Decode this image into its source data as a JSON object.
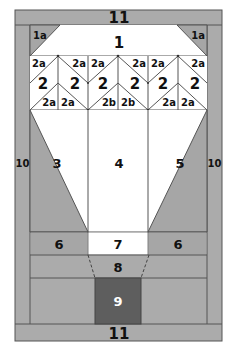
{
  "diagram": {
    "type": "quilt-block-piecing-diagram",
    "colors": {
      "background": "#ffffff",
      "frame": "#ababab",
      "mid_gray": "#a6a6a6",
      "dark": "#5e5e5e",
      "line": "#555555",
      "white_piece": "#ffffff"
    },
    "labels": {
      "top_border": "11",
      "bottom_border": "11",
      "left_side": "10",
      "right_side": "10",
      "top_center": "1",
      "top_left_corner": "1a",
      "top_right_corner": "1a",
      "geese_row": {
        "upper": [
          "2a",
          "2a",
          "2a",
          "2a",
          "2a",
          "2a"
        ],
        "middle": [
          "2",
          "2",
          "2",
          "2",
          "2",
          "2"
        ],
        "lower": [
          "2a",
          "2a",
          "2b",
          "2b",
          "2a",
          "2a"
        ]
      },
      "left_triangle": "3",
      "center_panel": "4",
      "right_triangle": "5",
      "left_band": "6",
      "center_band": "7",
      "right_band": "6",
      "neck": "8",
      "basket": "9"
    }
  }
}
